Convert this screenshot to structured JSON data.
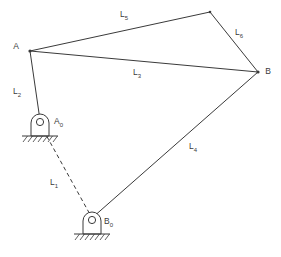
{
  "diagram": {
    "stroke_color": "#3a3a3a",
    "background_color": "#ffffff",
    "joints": [
      {
        "name": "A",
        "label": "A",
        "x": 30,
        "y": 51,
        "label_x": 16,
        "label_y": 47
      },
      {
        "name": "B",
        "label": "B",
        "x": 258,
        "y": 72,
        "label_x": 268,
        "label_y": 72
      },
      {
        "name": "C",
        "label": "",
        "x": 210,
        "y": 12,
        "label_x": 0,
        "label_y": 0
      },
      {
        "name": "A0",
        "label": "A",
        "sub": "0",
        "x": 40,
        "y": 122,
        "label_x": 54,
        "label_y": 122
      },
      {
        "name": "B0",
        "label": "B",
        "sub": "0",
        "x": 92,
        "y": 220,
        "label_x": 104,
        "label_y": 222
      }
    ],
    "links": [
      {
        "name": "L1",
        "label": "L",
        "sub": "1",
        "from": "A0",
        "to": "B0",
        "style": "dashed",
        "label_x": 54,
        "label_y": 183
      },
      {
        "name": "L2",
        "label": "L",
        "sub": "2",
        "from": "A",
        "to": "A0",
        "style": "solid",
        "label_x": 17,
        "label_y": 92
      },
      {
        "name": "L3",
        "label": "L",
        "sub": "3",
        "from": "A",
        "to": "B",
        "style": "solid",
        "label_x": 137,
        "label_y": 73
      },
      {
        "name": "L4",
        "label": "L",
        "sub": "4",
        "from": "B",
        "to": "B0",
        "style": "solid",
        "label_x": 193,
        "label_y": 147
      },
      {
        "name": "L5",
        "label": "L",
        "sub": "5",
        "from": "A",
        "to": "C",
        "style": "solid",
        "label_x": 124,
        "label_y": 15
      },
      {
        "name": "L6",
        "label": "L",
        "sub": "6",
        "from": "C",
        "to": "B",
        "style": "solid",
        "label_x": 239,
        "label_y": 33
      }
    ],
    "supports": [
      {
        "name": "support-a0",
        "cx": 40,
        "cy": 122,
        "ground_y": 136
      },
      {
        "name": "support-b0",
        "cx": 92,
        "cy": 220,
        "ground_y": 234
      }
    ]
  }
}
